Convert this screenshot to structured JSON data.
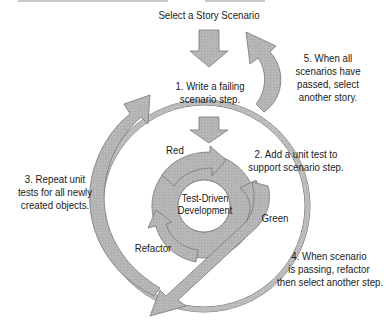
{
  "diagram": {
    "title": "Select a Story Scenario",
    "center_label": [
      "Test-Driven",
      "Development"
    ],
    "cycle_labels": {
      "red": "Red",
      "green": "Green",
      "refactor": "Refactor"
    },
    "steps": [
      {
        "id": 1,
        "lines": [
          "1. Write a failing",
          "scenario step."
        ]
      },
      {
        "id": 2,
        "lines": [
          "2. Add a unit test to",
          "support scenario step."
        ]
      },
      {
        "id": 3,
        "lines": [
          "3. Repeat unit",
          "tests for all newly",
          "created objects."
        ]
      },
      {
        "id": 4,
        "lines": [
          "4. When scenario",
          "is passing, refactor",
          "then select another step."
        ]
      },
      {
        "id": 5,
        "lines": [
          "5. When all",
          "scenarios have",
          "passed, select",
          "another story."
        ]
      }
    ],
    "colors": {
      "arrow_fill": "#b3b3b3",
      "arrow_stroke": "#6e6e6e",
      "text": "#1a1a1a",
      "background": "#ffffff"
    }
  }
}
